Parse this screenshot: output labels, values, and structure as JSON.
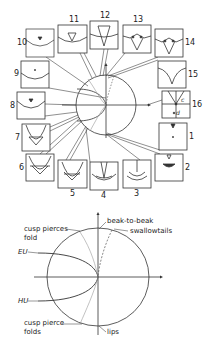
{
  "figure": {
    "top": {
      "description": "Bifurcation circle with 16 inset panels showing caustic/cusp configurations",
      "panels": [
        {
          "id": "1",
          "label": "1"
        },
        {
          "id": "2",
          "label": "2"
        },
        {
          "id": "3",
          "label": "3"
        },
        {
          "id": "4",
          "label": "4"
        },
        {
          "id": "5",
          "label": "5"
        },
        {
          "id": "6",
          "label": "6"
        },
        {
          "id": "7",
          "label": "7"
        },
        {
          "id": "8",
          "label": "8"
        },
        {
          "id": "9",
          "label": "9"
        },
        {
          "id": "10",
          "label": "10"
        },
        {
          "id": "11",
          "label": "11"
        },
        {
          "id": "12",
          "label": "12"
        },
        {
          "id": "13",
          "label": "13"
        },
        {
          "id": "14",
          "label": "14"
        },
        {
          "id": "15",
          "label": "15"
        },
        {
          "id": "16",
          "label": "16"
        }
      ],
      "panel16_annotations": {
        "c": "c",
        "d": "d"
      }
    },
    "bottom": {
      "labels": {
        "beak_to_beak": "beak-to-beak",
        "swallowtails": "swallowtails",
        "cusp_pierces_fold_1": "cusp pierces",
        "cusp_pierces_fold_2": "fold",
        "eu": "EU",
        "hu": "HU",
        "cusp_pierce_folds_1": "cusp pierce",
        "cusp_pierce_folds_2": "folds",
        "lips": "lips"
      }
    }
  }
}
